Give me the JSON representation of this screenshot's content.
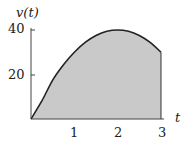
{
  "chart_data": {
    "type": "area",
    "title": "",
    "xlabel": "t",
    "ylabel": "v(t)",
    "x_ticks": [
      "1",
      "2",
      "3"
    ],
    "y_ticks": [
      "20",
      "40"
    ],
    "xlim": [
      0,
      3
    ],
    "ylim": [
      0,
      40
    ],
    "grid": false,
    "legend": null,
    "series": [
      {
        "name": "v(t)",
        "x": [
          0,
          0.25,
          0.5,
          0.75,
          1,
          1.25,
          1.5,
          1.75,
          2,
          2.25,
          2.5,
          2.75,
          3
        ],
        "values": [
          0,
          8.1,
          17.5,
          24.4,
          30,
          34.4,
          37.5,
          39.4,
          40,
          39.4,
          37.5,
          34.4,
          30
        ]
      }
    ],
    "fill": "#c9c9c9",
    "line_color": "#222222"
  },
  "labels": {
    "y_axis": "v(t)",
    "x_axis": "t",
    "y_tick_20": "20",
    "y_tick_40": "40",
    "x_tick_1": "1",
    "x_tick_2": "2",
    "x_tick_3": "3"
  }
}
